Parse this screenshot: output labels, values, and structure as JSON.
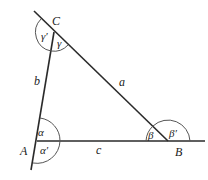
{
  "diagram": {
    "type": "triangle-interior-exterior-angles",
    "vertices": {
      "A": {
        "label": "A",
        "x": 37,
        "y": 141
      },
      "B": {
        "label": "B",
        "x": 168,
        "y": 141
      },
      "C": {
        "label": "C",
        "x": 54,
        "y": 32
      }
    },
    "sides": {
      "a": {
        "label": "a"
      },
      "b": {
        "label": "b"
      },
      "c": {
        "label": "c"
      }
    },
    "angles": {
      "alpha": "α",
      "alpha_prime": "α′",
      "beta": "β",
      "beta_prime": "β′",
      "gamma": "γ",
      "gamma_prime": "γ′"
    },
    "colors": {
      "line": "#2a2a2a",
      "arc": "#555555",
      "text": "#222222",
      "background": "#ffffff"
    }
  }
}
